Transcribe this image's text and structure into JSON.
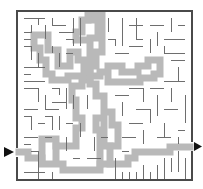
{
  "maze": {
    "title": "Maze puzzle with highlighted solution",
    "colors": {
      "background": "#ffffff",
      "wall": "#6e6e6e",
      "border": "#4a4a4a",
      "solution": "#b8b8b8",
      "arrow": "#111111"
    },
    "entrance": {
      "side": "left",
      "icon": "arrow-right-icon"
    },
    "exit": {
      "side": "right",
      "icon": "arrow-right-icon"
    },
    "bounds": {
      "left": 17,
      "top": 11,
      "right": 192,
      "bottom": 180
    }
  }
}
